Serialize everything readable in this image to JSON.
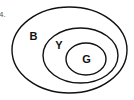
{
  "question_number": "4.",
  "diagram": {
    "type": "nested-venn",
    "stroke_color": "#111111",
    "background": "#ffffff",
    "sets": [
      {
        "label": "B",
        "level": "outer"
      },
      {
        "label": "Y",
        "level": "middle"
      },
      {
        "label": "G",
        "level": "inner"
      }
    ]
  }
}
